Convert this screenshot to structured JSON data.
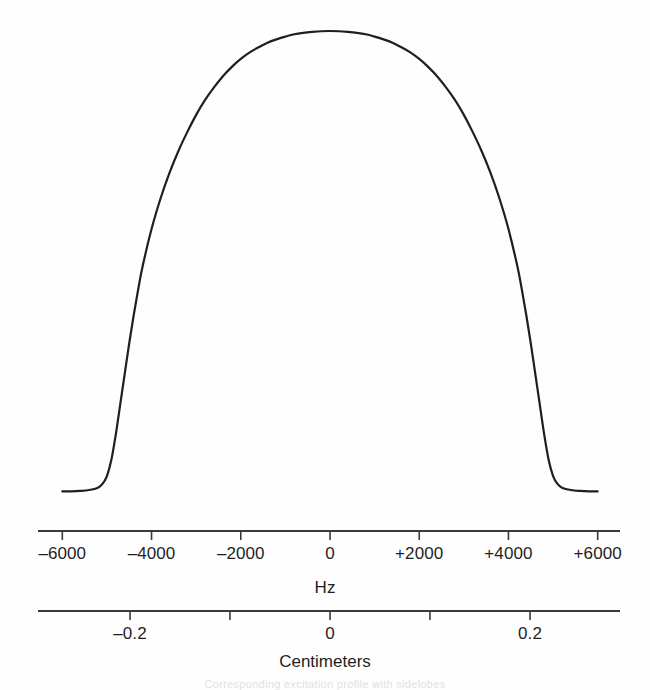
{
  "figure": {
    "type": "scientific-figure",
    "background_color": "#fefefe",
    "ink_color": "#1f1f1f",
    "caption_fragment": "Corresponding excitation profile with sidelobes"
  },
  "chart_data": {
    "type": "line",
    "title": "",
    "subtitle": "",
    "xlabel": "Hz",
    "ylabel": "",
    "grid": false,
    "legend": null,
    "series": [
      {
        "name": "slice excitation profile",
        "color": "#1f1f1f",
        "line_width": 2.2,
        "x": [
          -6000,
          -5800,
          -5600,
          -5400,
          -5200,
          -5100,
          -5000,
          -4900,
          -4800,
          -4700,
          -4600,
          -4500,
          -4400,
          -4300,
          -4200,
          -4000,
          -3800,
          -3600,
          -3400,
          -3200,
          -3000,
          -2800,
          -2600,
          -2400,
          -2200,
          -2000,
          -1800,
          -1600,
          -1400,
          -1200,
          -1000,
          -800,
          -600,
          -400,
          -200,
          0,
          200,
          400,
          600,
          800,
          1000,
          1200,
          1400,
          1600,
          1800,
          2000,
          2200,
          2400,
          2600,
          2800,
          3000,
          3200,
          3400,
          3600,
          3800,
          4000,
          4200,
          4300,
          4400,
          4500,
          4600,
          4700,
          4800,
          4900,
          5000,
          5100,
          5200,
          5400,
          5600,
          5800,
          6000
        ],
        "y": [
          0.012,
          0.012,
          0.013,
          0.015,
          0.02,
          0.028,
          0.045,
          0.08,
          0.135,
          0.2,
          0.265,
          0.33,
          0.39,
          0.445,
          0.495,
          0.575,
          0.64,
          0.695,
          0.742,
          0.783,
          0.82,
          0.852,
          0.879,
          0.903,
          0.923,
          0.94,
          0.954,
          0.965,
          0.975,
          0.982,
          0.988,
          0.993,
          0.996,
          0.998,
          0.9995,
          1.0,
          0.9995,
          0.998,
          0.996,
          0.993,
          0.988,
          0.982,
          0.975,
          0.965,
          0.954,
          0.94,
          0.923,
          0.903,
          0.879,
          0.852,
          0.82,
          0.783,
          0.742,
          0.695,
          0.64,
          0.575,
          0.495,
          0.445,
          0.39,
          0.33,
          0.265,
          0.2,
          0.135,
          0.08,
          0.045,
          0.028,
          0.02,
          0.015,
          0.013,
          0.012,
          0.012
        ]
      }
    ],
    "xlim": [
      -6500,
      6500
    ],
    "ylim": [
      0,
      1.08
    ],
    "peak": {
      "x": 0,
      "y": 1.0
    },
    "fwhm_hz": 8000,
    "baseline_level": 0.012,
    "flat_top": true
  },
  "frequency_axis": {
    "name": "Hz",
    "title": "Hz",
    "unit": "Hz",
    "ticks": [
      {
        "value": -6000,
        "label": "–6000"
      },
      {
        "value": -4000,
        "label": "–4000"
      },
      {
        "value": -2000,
        "label": "–2000"
      },
      {
        "value": 0,
        "label": "0"
      },
      {
        "value": 2000,
        "label": "+2000"
      },
      {
        "value": 4000,
        "label": "+4000"
      },
      {
        "value": 6000,
        "label": "+6000"
      }
    ],
    "range": [
      -6500,
      6500
    ]
  },
  "distance_axis": {
    "name": "Centimeters",
    "title": "Centimeters",
    "unit": "cm",
    "ticks": [
      {
        "value": -0.2,
        "label": "–0.2"
      },
      {
        "value": -0.1,
        "label": ""
      },
      {
        "value": 0,
        "label": "0"
      },
      {
        "value": 0.1,
        "label": ""
      },
      {
        "value": 0.2,
        "label": "0.2"
      }
    ],
    "range": [
      -0.29,
      0.29
    ]
  }
}
